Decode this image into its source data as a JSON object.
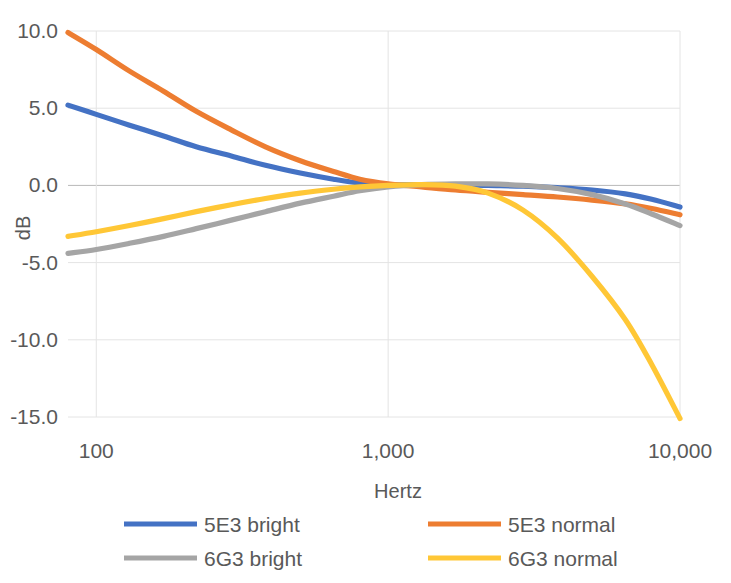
{
  "chart_data": {
    "type": "line",
    "title": "",
    "xlabel": "Hertz",
    "ylabel": "dB",
    "xscale": "log",
    "xlim": [
      80,
      10000
    ],
    "ylim": [
      -15.0,
      10.0
    ],
    "grid": true,
    "legend_position": "bottom",
    "x_ticks": [
      {
        "value": 100,
        "label": "100"
      },
      {
        "value": 1000,
        "label": "1,000"
      },
      {
        "value": 10000,
        "label": "10,000"
      }
    ],
    "y_ticks": [
      {
        "value": 10.0,
        "label": "10.0"
      },
      {
        "value": 5.0,
        "label": "5.0"
      },
      {
        "value": 0.0,
        "label": "0.0"
      },
      {
        "value": -5.0,
        "label": "-5.0"
      },
      {
        "value": -10.0,
        "label": "-10.0"
      },
      {
        "value": -15.0,
        "label": "-15.0"
      }
    ],
    "colors": {
      "5E3 bright": "#4472C4",
      "5E3 normal": "#ED7D31",
      "6G3 bright": "#A5A5A5",
      "6G3 normal": "#FFC736"
    },
    "x": [
      80,
      100,
      130,
      170,
      220,
      290,
      380,
      500,
      650,
      800,
      1000,
      1300,
      1700,
      2200,
      2900,
      3800,
      5000,
      6500,
      8000,
      10000
    ],
    "series": [
      {
        "name": "5E3 bright",
        "color": "#4472C4",
        "values": [
          5.2,
          4.6,
          3.9,
          3.2,
          2.5,
          1.9,
          1.3,
          0.8,
          0.4,
          0.15,
          0.05,
          0.05,
          0.05,
          0.0,
          -0.05,
          -0.15,
          -0.3,
          -0.55,
          -0.9,
          -1.4
        ]
      },
      {
        "name": "5E3 normal",
        "color": "#ED7D31",
        "values": [
          9.9,
          8.8,
          7.4,
          6.1,
          4.8,
          3.6,
          2.5,
          1.6,
          0.9,
          0.4,
          0.1,
          -0.1,
          -0.3,
          -0.45,
          -0.6,
          -0.75,
          -0.95,
          -1.2,
          -1.5,
          -1.9
        ]
      },
      {
        "name": "6G3 bright",
        "color": "#A5A5A5",
        "values": [
          -4.4,
          -4.15,
          -3.75,
          -3.3,
          -2.8,
          -2.25,
          -1.7,
          -1.15,
          -0.7,
          -0.35,
          -0.1,
          0.05,
          0.1,
          0.1,
          0.0,
          -0.2,
          -0.6,
          -1.2,
          -1.85,
          -2.6
        ]
      },
      {
        "name": "6G3 normal",
        "color": "#FFC736",
        "values": [
          -3.3,
          -3.0,
          -2.6,
          -2.15,
          -1.7,
          -1.25,
          -0.85,
          -0.5,
          -0.25,
          -0.1,
          0.0,
          0.05,
          -0.05,
          -0.5,
          -1.6,
          -3.4,
          -5.9,
          -8.7,
          -11.6,
          -15.1
        ]
      }
    ]
  },
  "legend": {
    "entries": [
      {
        "label": "5E3 bright",
        "color": "#4472C4"
      },
      {
        "label": "5E3 normal",
        "color": "#ED7D31"
      },
      {
        "label": "6G3 bright",
        "color": "#A5A5A5"
      },
      {
        "label": "6G3 normal",
        "color": "#FFC736"
      }
    ]
  },
  "axes": {
    "x_title": "Hertz",
    "y_title": "dB"
  }
}
